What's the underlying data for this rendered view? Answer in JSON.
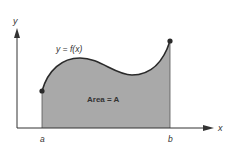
{
  "diagram": {
    "axes": {
      "x_label": "x",
      "y_label": "y"
    },
    "curve_label": "y = f(x)",
    "area_label": "Area = A",
    "bounds": {
      "left_label": "a",
      "right_label": "b"
    },
    "colors": {
      "fill": "#a9a9a9",
      "stroke": "#2a2a2a",
      "axis": "#333333",
      "background": "#ffffff"
    }
  }
}
